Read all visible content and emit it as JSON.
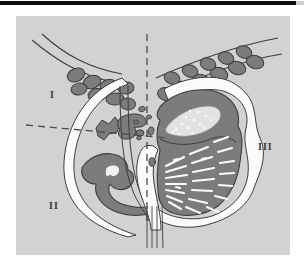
{
  "figure": {
    "kind": "anatomical-cross-section-diagram",
    "labels": [
      {
        "id": "I",
        "text": "I",
        "zone": "upper-left-quadrant"
      },
      {
        "id": "II",
        "text": "II",
        "zone": "lower-left-quadrant"
      },
      {
        "id": "III",
        "text": "III",
        "zone": "right-region"
      }
    ],
    "colors": {
      "page_background": "#ffffff",
      "top_bar": "#0d0d0d",
      "panel_background": "#d2d2d2",
      "tissue_fill": "#7c7c7c",
      "tissue_outline": "#3c3c3c",
      "duct_white": "#fbfbfb",
      "dashed_axis": "#4a4a4a",
      "label_text": "#3a3a3a",
      "speckle_light": "#f2f2f2"
    },
    "axes": {
      "vertical_dashed": {
        "x": 131,
        "y_top": 18,
        "y_bottom": 205,
        "style": "dashed"
      },
      "horizontal_dashed": {
        "x_left": 12,
        "y_left": 110,
        "x_right": 150,
        "y_right": 122,
        "style": "dashed"
      }
    },
    "structures": [
      {
        "name": "left-lobule-chain",
        "side": "left",
        "fill": "tissue"
      },
      {
        "name": "right-lobule-chain",
        "side": "right",
        "fill": "tissue"
      },
      {
        "name": "left-skin-contour",
        "side": "left",
        "fill": "duct-white"
      },
      {
        "name": "right-skin-contour",
        "side": "right",
        "fill": "duct-white"
      },
      {
        "name": "central-gland-mass",
        "side": "right",
        "fill": "tissue"
      },
      {
        "name": "upper-speckled-nodule",
        "side": "right",
        "fill": "speckle"
      },
      {
        "name": "radiating-duct-array",
        "side": "right",
        "fill": "duct-white"
      },
      {
        "name": "left-upper-glandular-cluster",
        "side": "left",
        "fill": "tissue"
      },
      {
        "name": "left-lower-glandular-mass",
        "side": "left",
        "fill": "tissue"
      },
      {
        "name": "nipple-duct-bundle",
        "side": "center",
        "fill": "duct-white"
      }
    ]
  }
}
